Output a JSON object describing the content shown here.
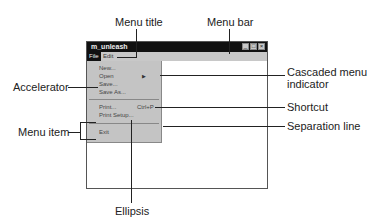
{
  "callouts": {
    "menu_title": "Menu title",
    "menu_bar": "Menu bar",
    "cascaded_menu_indicator_line1": "Cascaded menu",
    "cascaded_menu_indicator_line2": "indicator",
    "accelerator": "Accelerator",
    "shortcut": "Shortcut",
    "separation_line": "Separation line",
    "menu_item": "Menu item",
    "ellipsis": "Ellipsis"
  },
  "window": {
    "title": "m_unleash",
    "controls": [
      "_",
      "□",
      "×"
    ],
    "menubar": [
      {
        "label": "File",
        "active": true
      },
      {
        "label": "Edit",
        "active": false
      }
    ],
    "dropdown": {
      "items": [
        {
          "label": "New..."
        },
        {
          "label": "Open",
          "cascade": true
        },
        {
          "label": "Save..."
        },
        {
          "label": "Save As..."
        },
        {
          "separator": true
        },
        {
          "label": "Print...",
          "shortcut": "Ctrl+P"
        },
        {
          "label": "Print Setup..."
        },
        {
          "separator": true
        },
        {
          "label": "Exit"
        }
      ]
    }
  }
}
